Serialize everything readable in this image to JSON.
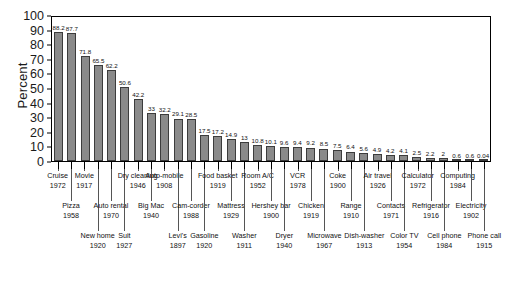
{
  "chart_data": {
    "type": "bar",
    "title": "",
    "xlabel": "",
    "ylabel": "Percent",
    "ylim": [
      0,
      100
    ],
    "ytick_values": [
      0,
      10,
      20,
      30,
      40,
      50,
      60,
      70,
      80,
      90,
      100
    ],
    "grid": false,
    "legend": "none",
    "bar_color": "#8a8a8a",
    "bar_edge_color": "#3c3c3c",
    "categories": [
      "Cruise",
      "Pizza",
      "Movie",
      "New home",
      "Auto rental",
      "Suit",
      "Dry cleaning",
      "Big Mac",
      "Auto-mobile",
      "Levi's",
      "Cam-corder",
      "Gasoline",
      "Food basket",
      "Mattress",
      "Washer",
      "Room A/C",
      "Hershey bar",
      "Dryer",
      "VCR",
      "Chicken",
      "Microwave",
      "Coke",
      "Range",
      "Dish-washer",
      "Air travel",
      "Contacts",
      "Color TV",
      "Calculator",
      "Refrigerator",
      "Cell phone",
      "Computing",
      "Electricity",
      "Phone call"
    ],
    "values": [
      88.2,
      87.7,
      71.8,
      65.5,
      62.2,
      50.6,
      42.2,
      33.0,
      32.2,
      29.1,
      28.5,
      17.5,
      17.2,
      14.9,
      13.0,
      10.8,
      10.1,
      9.6,
      9.4,
      9.2,
      8.5,
      7.5,
      6.4,
      5.6,
      4.9,
      4.2,
      4.1,
      2.5,
      2.2,
      2.0,
      0.6,
      0.6,
      0.04
    ],
    "years": [
      "1972",
      "1958",
      "1917",
      "1920",
      "1970",
      "1927",
      "1946",
      "1940",
      "1908",
      "1897",
      "1988",
      "1920",
      "1919",
      "1929",
      "1911",
      "1952",
      "1900",
      "1940",
      "1978",
      "1919",
      "1967",
      "1900",
      "1910",
      "1913",
      "1926",
      "1971",
      "1954",
      "1972",
      "1916",
      "1984",
      "1984",
      "1902",
      "1915"
    ],
    "label_rows": [
      0,
      1,
      0,
      2,
      1,
      2,
      0,
      1,
      0,
      2,
      1,
      2,
      0,
      1,
      2,
      0,
      1,
      2,
      0,
      1,
      2,
      0,
      1,
      2,
      0,
      1,
      2,
      0,
      1,
      2,
      0,
      1,
      2
    ]
  }
}
